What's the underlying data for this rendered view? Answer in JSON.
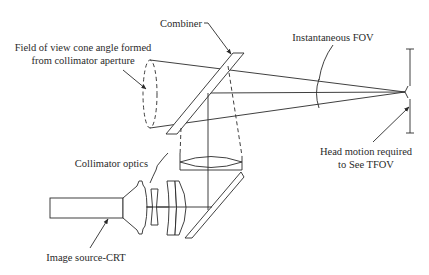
{
  "diagram": {
    "type": "optical-schematic",
    "labels": {
      "combiner": "Combiner",
      "fov_cone_line1": "Field of view cone angle formed",
      "fov_cone_line2": "from collimator aperture",
      "instantaneous_fov": "Instantaneous FOV",
      "head_motion_line1": "Head motion required",
      "head_motion_line2": "to See TFOV",
      "collimator_optics": "Collimator optics",
      "image_source": "Image source-CRT"
    },
    "components": [
      "image-source-crt",
      "collimator-lens-group",
      "fold-mirror",
      "field-lens",
      "combiner",
      "aperture-cone",
      "eye-position",
      "head-motion-range"
    ],
    "colors": {
      "line": "#2a2a2a",
      "background": "#ffffff"
    }
  }
}
